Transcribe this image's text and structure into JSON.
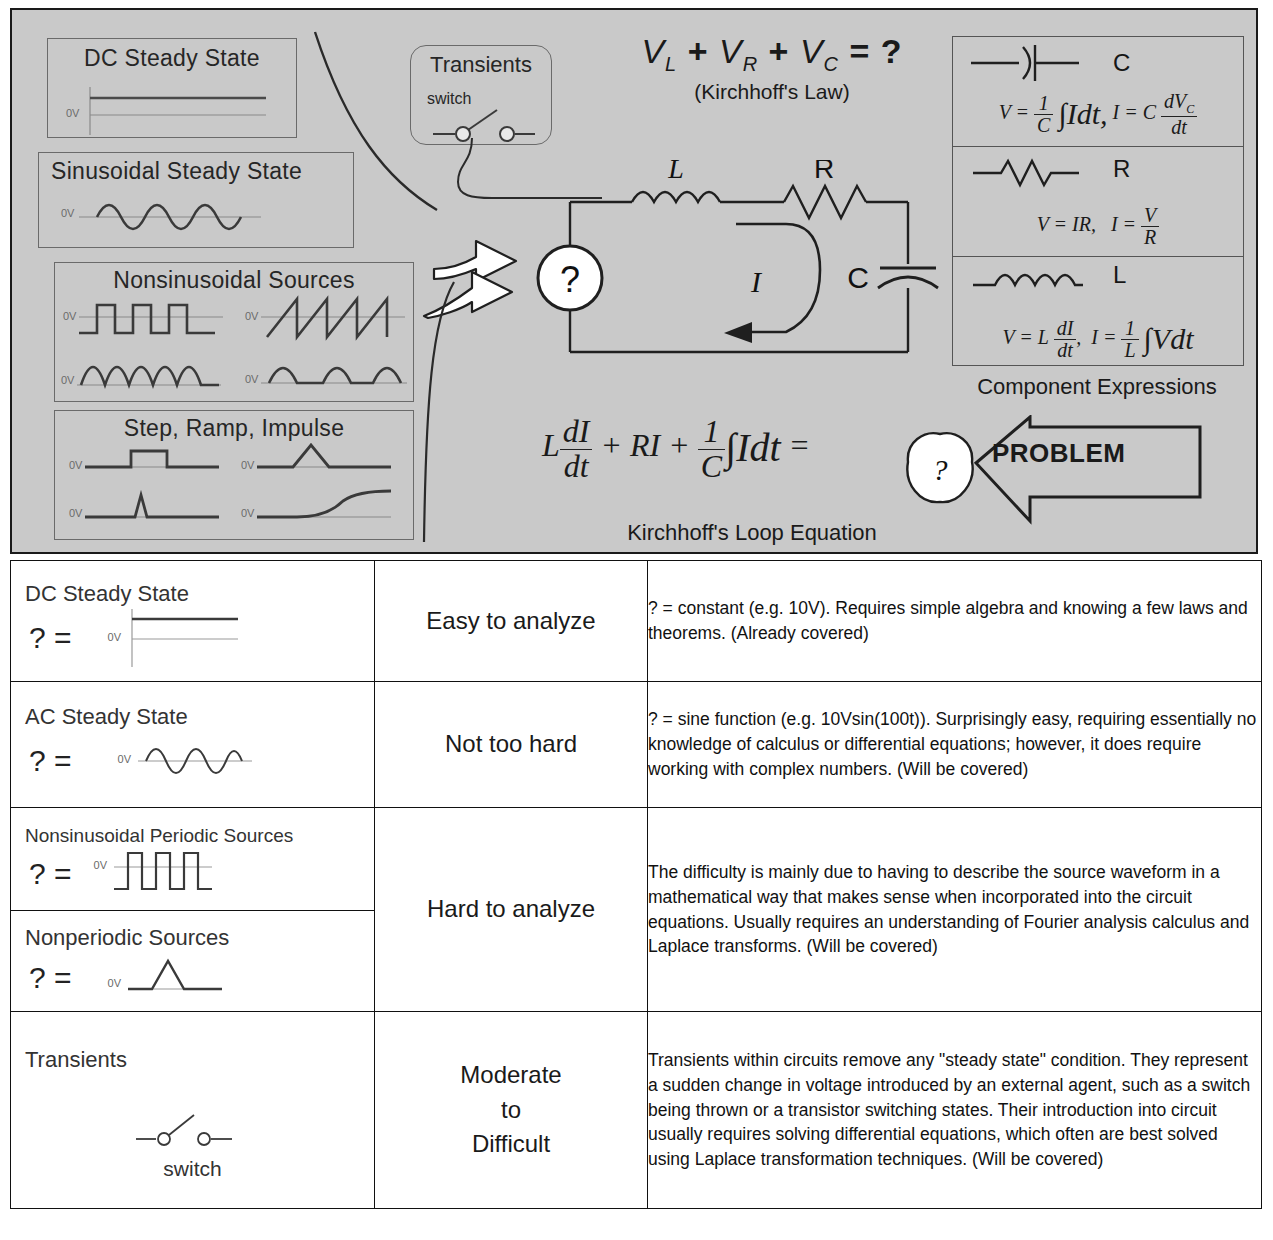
{
  "panel": {
    "sources": [
      {
        "id": "dc",
        "title": "DC Steady State",
        "zero_label": "0V"
      },
      {
        "id": "sine",
        "title": "Sinusoidal Steady State",
        "zero_label": "0V"
      },
      {
        "id": "nonsin",
        "title": "Nonsinusoidal Sources",
        "zero_label": "0V"
      },
      {
        "id": "step",
        "title": "Step, Ramp, Impulse",
        "zero_label": "0V"
      }
    ],
    "transients": {
      "title": "Transients",
      "switch_label": "switch"
    },
    "kirchhoff": {
      "v_l": "V",
      "v_l_sub": "L",
      "v_r": "V",
      "v_r_sub": "R",
      "v_c": "V",
      "v_c_sub": "C",
      "plus1": "+",
      "plus2": "+",
      "equals": "=",
      "question": "?",
      "caption": "(Kirchhoff's Law)"
    },
    "circuit": {
      "source_symbol": "?",
      "inductor_label": "L",
      "resistor_label": "R",
      "capacitor_label": "C",
      "current_label": "I"
    },
    "components": {
      "caption": "Component Expressions",
      "items": [
        {
          "symbol": "capacitor",
          "letter": "C",
          "formula_left": "V =",
          "frac_num": "1",
          "frac_den": "C",
          "integral": "∫Idt,",
          "formula_right": "I = C",
          "frac2_num": "dV",
          "frac2_num_sub": "C",
          "frac2_den": "dt"
        },
        {
          "symbol": "resistor",
          "letter": "R",
          "formula_left": "V = IR,",
          "formula_right": "I =",
          "frac_num": "V",
          "frac_den": "R"
        },
        {
          "symbol": "inductor",
          "letter": "L",
          "formula_left": "V = L",
          "frac_num": "dI",
          "frac_den": "dt",
          "comma": ",",
          "formula_right": "I =",
          "frac2_num": "1",
          "frac2_den": "L",
          "integral": "∫Vdt"
        }
      ]
    },
    "loop_equation": {
      "term1_coeff": "L",
      "term1_num": "dI",
      "term1_den": "dt",
      "plus1": "+",
      "term2": "RI",
      "plus2": "+",
      "term3_num": "1",
      "term3_den": "C",
      "term3_int": "∫Idt",
      "equals": "=",
      "result": "?",
      "caption": "Kirchhoff's Loop Equation",
      "problem": "PROBLEM"
    }
  },
  "table": {
    "rows": [
      {
        "label": "DC Steady State",
        "q_prefix": "? =",
        "waveform": "dc",
        "zero_label": "0V",
        "difficulty": "Easy to analyze",
        "description": "? = constant (e.g. 10V). Requires simple algebra and knowing a few laws and theorems. (Already covered)"
      },
      {
        "label": "AC Steady State",
        "q_prefix": "? =",
        "waveform": "sine",
        "zero_label": "0V",
        "difficulty": "Not too hard",
        "description": "? = sine function (e.g. 10Vsin(100t)). Surprisingly easy, requiring essentially no knowledge of calculus or differential equations; however, it does require working with complex numbers. (Will be covered)"
      },
      {
        "label": "Nonsinusoidal Periodic Sources",
        "q_prefix": "? =",
        "waveform": "square",
        "zero_label": "0V",
        "difficulty": "Hard to analyze",
        "description": "The difficulty is mainly due to having to describe the source waveform in a mathematical way that makes sense when incorporated into the circuit equations. Usually requires an understanding of Fourier analysis calculus and Laplace transforms.  (Will be covered)"
      },
      {
        "label": "Nonperiodic Sources",
        "q_prefix": "? =",
        "waveform": "triangle-pulse",
        "zero_label": "0V"
      },
      {
        "label": "Transients",
        "switch_label": "switch",
        "waveform": "switch",
        "difficulty": "Moderate\nto\nDifficult",
        "difficulty_line1": "Moderate",
        "difficulty_line2": "to",
        "difficulty_line3": "Difficult",
        "description": "Transients within circuits remove any \"steady state\" condition.  They represent a sudden change in voltage introduced by an external agent, such as a switch being thrown or a transistor switching states.  Their introduction into circuit usually requires solving differential equations, which often are best solved using Laplace transformation techniques.  (Will be covered)"
      }
    ]
  },
  "colors": {
    "panel_bg": "#c9c9c9",
    "line": "#1a1a1a",
    "faint": "#8a8a8a"
  }
}
